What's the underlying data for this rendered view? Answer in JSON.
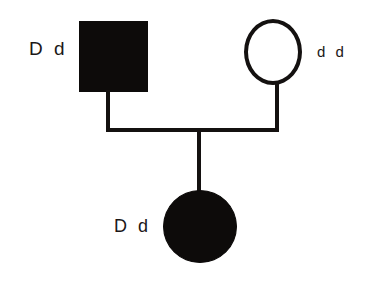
{
  "diagram": {
    "type": "pedigree-chart",
    "background_color": "#ffffff",
    "line_color": "#141110",
    "fill_color": "#0d0b0a",
    "individuals": [
      {
        "id": "father",
        "shape": "square",
        "sex": "male",
        "affected": true,
        "fill": "filled",
        "genotype": "D d",
        "generation": 1
      },
      {
        "id": "mother",
        "shape": "circle",
        "sex": "female",
        "affected": false,
        "fill": "open",
        "genotype": "d d",
        "generation": 1
      },
      {
        "id": "child",
        "shape": "circle",
        "sex": "female",
        "affected": true,
        "fill": "filled",
        "genotype": "D d",
        "generation": 2
      }
    ],
    "connections": [
      {
        "id": "father-descender",
        "from": "father",
        "to": "mating-line"
      },
      {
        "id": "mother-descender",
        "from": "mother",
        "to": "mating-line"
      },
      {
        "id": "mating-line",
        "between": [
          "father",
          "mother"
        ]
      },
      {
        "id": "child-descender",
        "from": "mating-line",
        "to": "child"
      }
    ]
  }
}
